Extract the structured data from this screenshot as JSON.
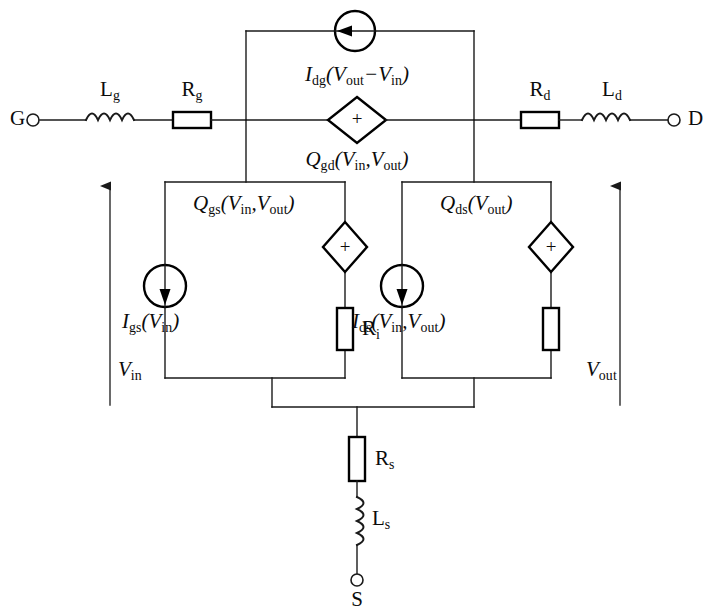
{
  "figure": {
    "name": "fet-small-signal-equivalent-circuit",
    "line_color": "#1a1a1a",
    "thick_color": "#000000",
    "background": "#ffffff"
  },
  "terminals": {
    "gate": "G",
    "drain": "D",
    "source": "S"
  },
  "components": {
    "lg": {
      "label_main": "L",
      "label_sub": "g"
    },
    "rg": {
      "label_main": "R",
      "label_sub": "g"
    },
    "rd": {
      "label_main": "R",
      "label_sub": "d"
    },
    "ld": {
      "label_main": "L",
      "label_sub": "d"
    },
    "ri": {
      "label_main": "R",
      "label_sub": "i"
    },
    "rs": {
      "label_main": "R",
      "label_sub": "s"
    },
    "ls": {
      "label_main": "L",
      "label_sub": "s"
    }
  },
  "sources": {
    "idg": {
      "type": "current-source",
      "symbol": "I",
      "symbol_sub": "dg",
      "arg": "(V",
      "arg_sub1": "out",
      "arg_mid": "−V",
      "arg_sub2": "in",
      "arg_close": ")",
      "full_text": "I_dg(V_out − V_in)"
    },
    "qgd": {
      "type": "charge-source",
      "polarity": "+",
      "symbol": "Q",
      "symbol_sub": "gd",
      "arg": "(V",
      "arg_sub1": "in",
      "arg_mid": ",V",
      "arg_sub2": "out",
      "arg_close": ")",
      "full_text": "Q_gd(V_in,V_out)"
    },
    "qgs": {
      "type": "charge-source",
      "polarity": "+",
      "symbol": "Q",
      "symbol_sub": "gs",
      "arg": "(V",
      "arg_sub1": "in",
      "arg_mid": ",V",
      "arg_sub2": "out",
      "arg_close": ")",
      "full_text": "Q_gs(V_in,V_out)"
    },
    "igs": {
      "type": "current-source",
      "symbol": "I",
      "symbol_sub": "gs",
      "arg": "(V",
      "arg_sub1": "in",
      "arg_close": ")",
      "full_text": "I_gs(V_in)"
    },
    "qds": {
      "type": "charge-source",
      "polarity": "+",
      "symbol": "Q",
      "symbol_sub": "ds",
      "arg": "(V",
      "arg_sub1": "out",
      "arg_close": ")",
      "full_text": "Q_ds(V_out)"
    },
    "ids": {
      "type": "current-source",
      "symbol": "I",
      "symbol_sub": "ds",
      "arg": "(V",
      "arg_sub1": "in",
      "arg_mid": ",V",
      "arg_sub2": "out",
      "arg_close": ")",
      "full_text": "I_ds(V_in,V_out)"
    }
  },
  "voltages": {
    "vin": {
      "symbol": "V",
      "symbol_sub": "in",
      "full_text": "V_in",
      "arrow": "up"
    },
    "vout": {
      "symbol": "V",
      "symbol_sub": "out",
      "full_text": "V_out",
      "arrow": "up"
    }
  }
}
